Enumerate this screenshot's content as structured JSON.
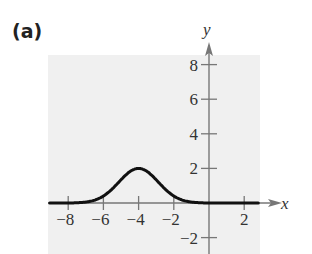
{
  "panel_label": "(a)",
  "colors": {
    "background": "#ffffff",
    "plot_area": "#f0f0f0",
    "axis": "#777777",
    "curve": "#111111",
    "text": "#333333"
  },
  "chart_data": {
    "type": "line",
    "title": "",
    "xlabel": "x",
    "ylabel": "y",
    "xlim": [
      -9,
      2.5
    ],
    "ylim": [
      -3,
      9
    ],
    "grid": false,
    "legend": null,
    "x_ticks": [
      -8,
      -6,
      -4,
      -2,
      2
    ],
    "x_tick_labels": [
      "−8",
      "−6",
      "−4",
      "−2",
      "2"
    ],
    "y_ticks": [
      8,
      6,
      4,
      2,
      -2
    ],
    "y_tick_labels": [
      "8",
      "6",
      "4",
      "2",
      "−2"
    ],
    "series": [
      {
        "name": "f(x)",
        "description": "bell-shaped curve with maximum 2 at x = -4, approaching 0 on both sides",
        "x": [
          -9,
          -8,
          -7,
          -6,
          -5.5,
          -5,
          -4.5,
          -4,
          -3.5,
          -3,
          -2.5,
          -2,
          -1,
          0,
          1,
          2,
          2.5
        ],
        "y": [
          0.0,
          0.0,
          0.05,
          0.4,
          0.81,
          1.34,
          1.81,
          2.0,
          1.81,
          1.34,
          0.81,
          0.4,
          0.05,
          0.0,
          0.0,
          0.0,
          0.0
        ]
      }
    ],
    "peak": {
      "x": -4,
      "y": 2
    }
  }
}
